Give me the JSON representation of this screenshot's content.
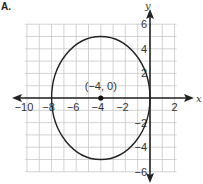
{
  "option_label": "A.",
  "chart_data": {
    "type": "line",
    "title": "",
    "xlabel": "x",
    "ylabel": "y",
    "xlim": [
      -10,
      2
    ],
    "ylim": [
      -6,
      6
    ],
    "grid": true,
    "x_ticks": [
      -10,
      -8,
      -6,
      -4,
      -2,
      2
    ],
    "x_tick_labels": [
      "−10",
      "−8",
      "−6",
      "−4",
      "−2",
      "2"
    ],
    "y_ticks": [
      6,
      4,
      2,
      -2,
      -4,
      -6
    ],
    "y_tick_labels": [
      "6",
      "4",
      "2",
      "−2",
      "−4",
      "−6"
    ],
    "series": [
      {
        "name": "ellipse",
        "shape": "ellipse",
        "center": [
          -4,
          0
        ],
        "semi_axis_x": 4,
        "semi_axis_y": 5,
        "vertices": [
          [
            -4,
            5
          ],
          [
            -4,
            -5
          ]
        ],
        "co_vertices": [
          [
            -8,
            0
          ],
          [
            0,
            0
          ]
        ]
      }
    ],
    "points": [
      {
        "x": -4,
        "y": 0,
        "label": "(−4, 0)"
      }
    ],
    "annotations": [
      "(−4, 0)"
    ]
  }
}
